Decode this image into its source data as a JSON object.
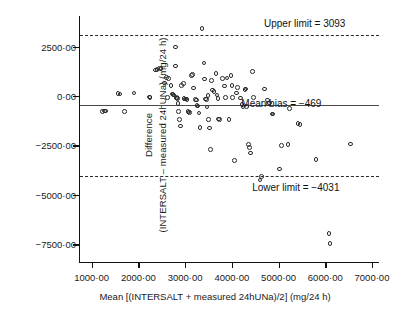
{
  "chart_data": {
    "type": "scatter",
    "title": "",
    "xlabel": "Mean [(INTERSALT + measured 24hUNa)/2] (mg/24 h)",
    "ylabel_line1": "Difference",
    "ylabel_line2": "(INTERSALT – measured 24hUNa) (mg/24 h)",
    "xlim": [
      750,
      7150
    ],
    "ylim": [
      -8400,
      4050
    ],
    "grid": false,
    "legend": "none",
    "xticks": [
      1000,
      2000,
      3000,
      4000,
      5000,
      6000,
      7000
    ],
    "xtick_labels": [
      "1000·00",
      "2000·00",
      "3000·00",
      "4000·00",
      "5000·00",
      "6000·00",
      "7000·00"
    ],
    "yticks": [
      2500,
      0,
      -2500,
      -5000,
      -7500
    ],
    "ytick_labels": [
      "2500·00",
      "0·00",
      "−2500·00",
      "−5000·00",
      "−7500·00"
    ],
    "reference_lines": [
      {
        "name": "upper-limit",
        "value": 3093,
        "style": "dashed",
        "label": "Upper limit = 3093"
      },
      {
        "name": "mean-bias",
        "value": -469,
        "style": "solid",
        "label": "Mean bias = −469"
      },
      {
        "name": "lower-limit",
        "value": -4031,
        "style": "dashed",
        "label": "Lower limit = −4031"
      }
    ],
    "annotations": [
      {
        "name": "upper-limit-label",
        "text": "Upper limit = 3093",
        "x": 5560,
        "y": 3720
      },
      {
        "name": "mean-bias-label",
        "text": "Mean bias = −469",
        "x": 5060,
        "y": -360
      },
      {
        "name": "lower-limit-label",
        "text": "Lower limit = −4031",
        "x": 5370,
        "y": -4620
      },
      {
        "name": "mean-bias-marker",
        "text": "",
        "x": 4810,
        "y": -360
      }
    ],
    "points": [
      [
        1230,
        -770
      ],
      [
        1270,
        -750
      ],
      [
        1300,
        -760
      ],
      [
        1560,
        120
      ],
      [
        1610,
        110
      ],
      [
        1700,
        -780
      ],
      [
        1910,
        160
      ],
      [
        2240,
        -50
      ],
      [
        2250,
        -60
      ],
      [
        2360,
        1320
      ],
      [
        2400,
        1330
      ],
      [
        2450,
        1400
      ],
      [
        2480,
        1390
      ],
      [
        2560,
        650
      ],
      [
        2600,
        930
      ],
      [
        2620,
        -70
      ],
      [
        2640,
        880
      ],
      [
        2700,
        530
      ],
      [
        2720,
        100
      ],
      [
        2740,
        90
      ],
      [
        2760,
        60
      ],
      [
        2790,
        2480
      ],
      [
        2800,
        1510
      ],
      [
        2810,
        -60
      ],
      [
        2820,
        -90
      ],
      [
        2830,
        -100
      ],
      [
        2840,
        -120
      ],
      [
        2850,
        -390
      ],
      [
        2860,
        -770
      ],
      [
        2880,
        -1190
      ],
      [
        2900,
        -1520
      ],
      [
        2920,
        520
      ],
      [
        2960,
        640
      ],
      [
        2980,
        -120
      ],
      [
        3000,
        -150
      ],
      [
        3020,
        -160
      ],
      [
        3040,
        -180
      ],
      [
        3060,
        -770
      ],
      [
        3080,
        -800
      ],
      [
        3100,
        -830
      ],
      [
        3140,
        1030
      ],
      [
        3160,
        1100
      ],
      [
        3180,
        400
      ],
      [
        3220,
        -170
      ],
      [
        3240,
        -200
      ],
      [
        3250,
        -480
      ],
      [
        3280,
        -500
      ],
      [
        3300,
        -860
      ],
      [
        3320,
        -1600
      ],
      [
        3360,
        3420
      ],
      [
        3400,
        1680
      ],
      [
        3420,
        860
      ],
      [
        3440,
        -150
      ],
      [
        3460,
        -170
      ],
      [
        3470,
        -560
      ],
      [
        3490,
        40
      ],
      [
        3500,
        -1190
      ],
      [
        3520,
        -1610
      ],
      [
        3540,
        -2710
      ],
      [
        3560,
        780
      ],
      [
        3580,
        300
      ],
      [
        3620,
        230
      ],
      [
        3660,
        1150
      ],
      [
        3680,
        60
      ],
      [
        3700,
        -120
      ],
      [
        3720,
        -1170
      ],
      [
        3740,
        -1190
      ],
      [
        3800,
        880
      ],
      [
        3840,
        500
      ],
      [
        3860,
        -60
      ],
      [
        3900,
        920
      ],
      [
        3940,
        -1180
      ],
      [
        3980,
        1050
      ],
      [
        4000,
        520
      ],
      [
        4020,
        -70
      ],
      [
        4060,
        -3270
      ],
      [
        4100,
        150
      ],
      [
        4120,
        440
      ],
      [
        4180,
        -100
      ],
      [
        4220,
        -430
      ],
      [
        4240,
        -550
      ],
      [
        4280,
        340
      ],
      [
        4300,
        350
      ],
      [
        4320,
        -520
      ],
      [
        4360,
        -2460
      ],
      [
        4380,
        -2600
      ],
      [
        4400,
        -2880
      ],
      [
        4440,
        1250
      ],
      [
        4460,
        -80
      ],
      [
        4600,
        -4250
      ],
      [
        4640,
        -4060
      ],
      [
        4700,
        360
      ],
      [
        4760,
        -200
      ],
      [
        4780,
        -390
      ],
      [
        4860,
        -900
      ],
      [
        4880,
        -920
      ],
      [
        5020,
        -3700
      ],
      [
        5060,
        -2500
      ],
      [
        5200,
        -2460
      ],
      [
        5240,
        -640
      ],
      [
        5420,
        -1400
      ],
      [
        5460,
        -1430
      ],
      [
        5800,
        -3200
      ],
      [
        6080,
        -6950
      ],
      [
        6100,
        -7460
      ],
      [
        6540,
        -2420
      ]
    ]
  }
}
